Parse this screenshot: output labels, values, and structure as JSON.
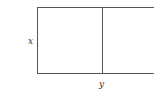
{
  "diagram": {
    "type": "partitioned-rectangle",
    "labels": {
      "side": "x",
      "bottom": "y"
    },
    "colors": {
      "stroke": "#555555",
      "text": "#333333",
      "background": "#ffffff"
    }
  }
}
